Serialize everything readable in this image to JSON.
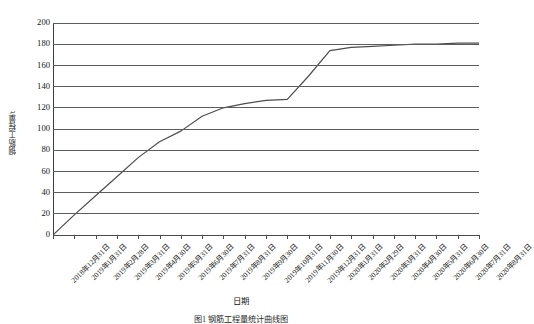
{
  "chart_data": {
    "type": "line",
    "title": "",
    "xlabel": "日期",
    "ylabel": "钢筋工程量/t",
    "ylim": [
      0,
      200
    ],
    "ytick_step": 20,
    "yticks": [
      200,
      180,
      160,
      140,
      120,
      100,
      80,
      60,
      40,
      20,
      0
    ],
    "grid": true,
    "legend": false,
    "legend_position": "none",
    "categories": [
      "2018年12月31日",
      "2019年1月31日",
      "2019年2月28日",
      "2019年3月31日",
      "2019年4月30日",
      "2019年5月31日",
      "2019年6月30日",
      "2019年7月31日",
      "2019年8月31日",
      "2019年9月30日",
      "2019年10月31日",
      "2019年11月30日",
      "2019年12月31日",
      "2020年1月31日",
      "2020年2月29日",
      "2020年3月31日",
      "2020年4月30日",
      "2020年5月31日",
      "2020年6月30日",
      "2020年7月31日",
      "2020年8月31日"
    ],
    "values": [
      0,
      19,
      37,
      55,
      73,
      88,
      98,
      112,
      120,
      124,
      127,
      128,
      150,
      174,
      177,
      178,
      179,
      180,
      180,
      181,
      181
    ],
    "series": [
      {
        "name": "钢筋工程量累计",
        "color": "#4d4d4d",
        "values": [
          0,
          19,
          37,
          55,
          73,
          88,
          98,
          112,
          120,
          124,
          127,
          128,
          150,
          174,
          177,
          178,
          179,
          180,
          180,
          181,
          181
        ]
      }
    ],
    "annotations": []
  },
  "axes": {
    "y_title": "钢筋工程量/t",
    "x_title": "日期"
  },
  "caption": {
    "text": "图1  钢筋工程量统计曲线图"
  },
  "colors": {
    "line": "#4d4d4d",
    "grid": "#5d5d5d",
    "axis": "#3d3d3d",
    "background": "#ffffff"
  }
}
